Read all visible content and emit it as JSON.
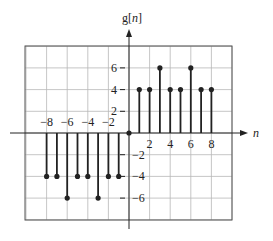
{
  "chart_data": {
    "type": "stem",
    "title": "",
    "ylabel": "g[n]",
    "xlabel": "n",
    "x": [
      -8,
      -7,
      -6,
      -5,
      -4,
      -3,
      -2,
      -1,
      0,
      1,
      2,
      3,
      4,
      5,
      6,
      7,
      8
    ],
    "values": [
      -4,
      -4,
      -6,
      -4,
      -4,
      -6,
      -4,
      -4,
      0,
      4,
      4,
      6,
      4,
      4,
      6,
      4,
      4
    ],
    "x_ticks": [
      -8,
      -6,
      -4,
      -2,
      2,
      4,
      6,
      8
    ],
    "x_tick_labels": [
      "−8",
      "−6",
      "−4",
      "−2",
      "2",
      "4",
      "6",
      "8"
    ],
    "y_ticks": [
      6,
      4,
      2,
      -2,
      -4,
      -6
    ],
    "y_tick_labels": [
      "6",
      "4",
      "2",
      "−2",
      "−4",
      "−6"
    ],
    "xlim": [
      -10,
      10
    ],
    "ylim": [
      -8,
      8
    ],
    "grid": true,
    "legend": null
  },
  "labels": {
    "y_axis": "g[n]",
    "x_axis": "n"
  },
  "colors": {
    "stem": "#222222",
    "grid": "#b8b8b8",
    "axis": "#222222"
  }
}
